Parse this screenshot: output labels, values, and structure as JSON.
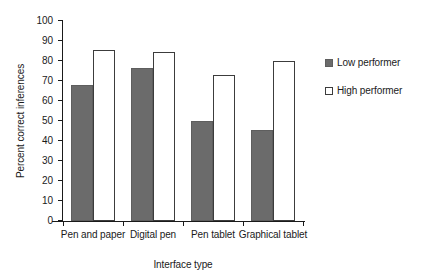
{
  "chart_data": {
    "type": "bar",
    "title": "",
    "xlabel": "Interface type",
    "ylabel": "Percent correct inferences",
    "categories": [
      "Pen and paper",
      "Digital pen",
      "Pen tablet",
      "Graphical tablet"
    ],
    "series": [
      {
        "name": "Low performer",
        "values": [
          68,
          76.5,
          50,
          45.5
        ],
        "color": "#6b6b6b"
      },
      {
        "name": "High performer",
        "values": [
          85.5,
          84.5,
          73,
          80
        ],
        "color": "#ffffff"
      }
    ],
    "ylim": [
      0,
      100
    ],
    "ytick_labels": [
      "100",
      "90",
      "80",
      "70",
      "60",
      "50",
      "40",
      "30",
      "20",
      "10",
      "0"
    ],
    "ytick_values": [
      100,
      90,
      80,
      70,
      60,
      50,
      40,
      30,
      20,
      10,
      0
    ],
    "ytick_step": 10,
    "grid": false,
    "legend_position": "right"
  },
  "legend": {
    "items": [
      {
        "label": "Low performer",
        "swatch": "filled-gray-square"
      },
      {
        "label": "High performer",
        "swatch": "open-white-square"
      }
    ]
  },
  "axes": {
    "y_title": "Percent correct inferences",
    "x_title": "Interface type"
  }
}
